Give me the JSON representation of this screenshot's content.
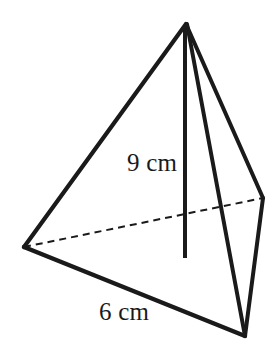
{
  "figure": {
    "name": "triangular-pyramid-tetrahedron-diagram",
    "background_color": "#ffffff",
    "stroke_color": "#1a1a1a",
    "labels": {
      "height": "9 cm",
      "base": "6 cm"
    },
    "measurements": [
      {
        "id": "height",
        "value": 9,
        "unit": "cm",
        "text": "9 cm",
        "refers_to": "vertical-height-line"
      },
      {
        "id": "base_edge",
        "value": 6,
        "unit": "cm",
        "text": "6 cm",
        "refers_to": "front-base-edge"
      }
    ],
    "vertices": {
      "apex": {
        "x": 186,
        "y": 24
      },
      "base_left": {
        "x": 24,
        "y": 247
      },
      "base_front_right": {
        "x": 245,
        "y": 336
      },
      "base_back_right": {
        "x": 263,
        "y": 198
      },
      "height_foot": {
        "x": 186,
        "y": 258
      }
    },
    "edges": [
      {
        "id": "apex-to-base-left",
        "from": "apex",
        "to": "base_left",
        "style": "solid",
        "width": 4
      },
      {
        "id": "apex-to-base-front-right",
        "from": "apex",
        "to": "base_front_right",
        "style": "solid",
        "width": 4
      },
      {
        "id": "apex-to-base-back-right",
        "from": "apex",
        "to": "base_back_right",
        "style": "solid",
        "width": 4
      },
      {
        "id": "base-left-to-base-front-right",
        "from": "base_left",
        "to": "base_front_right",
        "style": "solid",
        "width": 4
      },
      {
        "id": "base-back-right-to-base-front-right",
        "from": "base_back_right",
        "to": "base_front_right",
        "style": "solid",
        "width": 4
      },
      {
        "id": "base-left-to-base-back-right-hidden",
        "from": "base_left",
        "to": "base_back_right",
        "style": "dashed",
        "width": 2
      },
      {
        "id": "vertical-height-line",
        "from": "apex",
        "to": "height_foot",
        "style": "solid",
        "width": 4
      }
    ]
  }
}
